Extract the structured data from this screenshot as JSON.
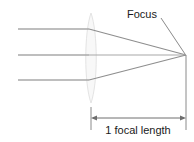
{
  "diagram": {
    "labels": {
      "focus": "Focus",
      "focal_length": "1 focal length"
    },
    "colors": {
      "ray": "#9a9a9a",
      "ray_light": "#b4b4b4",
      "lens_outline": "#e2e2e2",
      "lens_fill": "#f7f7f7",
      "leader": "#8a8a8a",
      "dimension": "#6e6e6e",
      "text": "#1a1a1a",
      "background": "#ffffff"
    },
    "geometry": {
      "lens": {
        "center_x": 91,
        "top_y": 13,
        "bottom_y": 103,
        "half_width": 7
      },
      "focus_point": {
        "x": 186,
        "y": 55
      },
      "rays": [
        {
          "name": "upper-ray",
          "entry_y": 29,
          "start_x": 18
        },
        {
          "name": "axis-ray",
          "entry_y": 55,
          "start_x": 18
        },
        {
          "name": "lower-ray",
          "entry_y": 80,
          "start_x": 18
        }
      ],
      "dimension_line": {
        "y": 118,
        "left_x": 91,
        "right_x": 186,
        "tick_top_y": 107,
        "tick_bottom_y": 130
      },
      "leader_line": {
        "x1": 161,
        "y1": 18,
        "x2": 185,
        "y2": 54
      }
    }
  }
}
